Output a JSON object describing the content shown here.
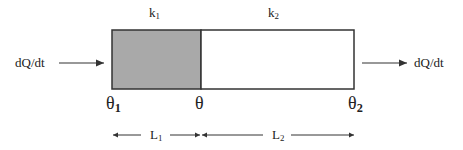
{
  "diagram": {
    "layers": [
      {
        "id": "layer1",
        "conductivity": "k",
        "conductivity_sub": "1",
        "length": "L",
        "length_sub": "1",
        "fill": "#a9a9a9"
      },
      {
        "id": "layer2",
        "conductivity": "k",
        "conductivity_sub": "2",
        "length": "L",
        "length_sub": "2",
        "fill": "#ffffff"
      }
    ],
    "heat_in": "dQ/dt",
    "heat_out": "dQ/dt",
    "temperatures": {
      "left": "θ",
      "left_sub": "1",
      "interface": "θ",
      "right": "θ",
      "right_sub": "2"
    },
    "stroke_color": "#333333"
  }
}
